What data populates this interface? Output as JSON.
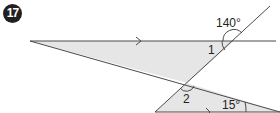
{
  "problem": {
    "number": "17"
  },
  "diagram": {
    "angle_labels": {
      "given_top": "140°",
      "unknown_1": "1",
      "unknown_2": "2",
      "given_bottom": "15°"
    },
    "colors": {
      "line": "#4a4a4a",
      "shade": "#e6e6e6",
      "badge": "#231f20"
    }
  }
}
